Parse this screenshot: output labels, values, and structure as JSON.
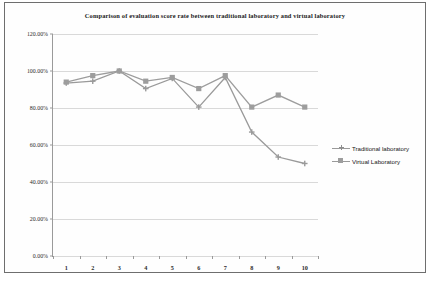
{
  "chart_data": {
    "type": "line",
    "title": "Comparison of evaluation score rate between traditional laboratory and virtual laboratory",
    "xlabel": "",
    "ylabel": "",
    "categories": [
      "1",
      "2",
      "3",
      "4",
      "5",
      "6",
      "7",
      "8",
      "9",
      "10"
    ],
    "x": [
      1,
      2,
      3,
      4,
      5,
      6,
      7,
      8,
      9,
      10
    ],
    "ylim": [
      0,
      120
    ],
    "ytick_values": [
      0,
      20,
      40,
      60,
      80,
      100,
      120
    ],
    "ytick_labels": [
      "0.00%",
      "20.00%",
      "40.00%",
      "60.00%",
      "80.00%",
      "100.00%",
      "120.00%"
    ],
    "grid": true,
    "legend_position": "right",
    "series": [
      {
        "name": "Traditional laboratory",
        "marker": "cross",
        "color": "#9a9a9a",
        "values": [
          93.5,
          94.5,
          100.0,
          90.5,
          96.0,
          80.5,
          96.5,
          67.0,
          53.5,
          50.0
        ]
      },
      {
        "name": "Virtual Laboratory",
        "marker": "square",
        "color": "#9d9d9d",
        "values": [
          94.0,
          97.5,
          100.0,
          94.5,
          96.5,
          90.5,
          97.5,
          80.5,
          87.0,
          80.5
        ]
      }
    ]
  },
  "legend": {
    "items": [
      {
        "label": "Traditional laboratory",
        "marker": "cross-marker-icon"
      },
      {
        "label": "Virtual Laboratory",
        "marker": "square-marker-icon"
      }
    ]
  },
  "caption": {
    "text": ""
  },
  "colors": {
    "series_gray": "#9a9a9a",
    "gridline": "#d9d9d9",
    "axis": "#9a9a9a",
    "frame_border": "#6e6e6e",
    "text": "#1a1a1a",
    "background": "#ffffff"
  }
}
